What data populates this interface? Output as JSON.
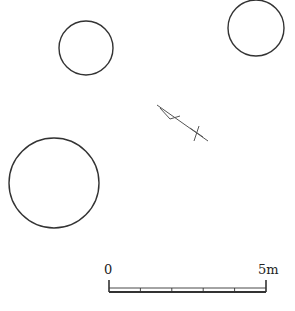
{
  "diagram": {
    "type": "archaeological site plan",
    "stroke_color": "#333333",
    "features": [
      {
        "name": "pit-1",
        "shape": "circle",
        "cx": 86,
        "cy": 48,
        "r": 27
      },
      {
        "name": "pit-2",
        "shape": "circle",
        "cx": 256,
        "cy": 28,
        "r": 28
      },
      {
        "name": "pit-3",
        "shape": "circle",
        "cx": 54,
        "cy": 183,
        "r": 45
      }
    ],
    "marker": {
      "name": "north-arrow",
      "line": [
        157,
        105,
        208,
        141
      ],
      "hook": [
        [
          160,
          108
        ],
        [
          170,
          119
        ],
        [
          180,
          116
        ]
      ],
      "cross": [
        [
          190,
          128,
          203,
          137
        ],
        [
          199,
          126,
          194,
          141
        ]
      ]
    },
    "scale_bar": {
      "start_label": "0",
      "end_label": "5m",
      "x0": 109,
      "x1": 266,
      "y_top": 282,
      "y_bottom": 292,
      "divisions": 5
    }
  }
}
